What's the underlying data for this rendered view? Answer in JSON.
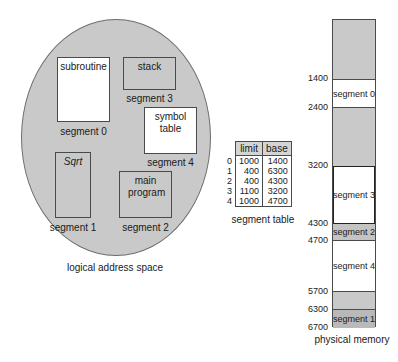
{
  "logical_space": {
    "caption": "logical address space",
    "segments": [
      {
        "name": "subroutine",
        "label": "segment 0"
      },
      {
        "name": "Sqrt",
        "label": "segment 1"
      },
      {
        "name": "main program",
        "label": "segment 2"
      },
      {
        "name": "stack",
        "label": "segment 3"
      },
      {
        "name": "symbol table",
        "label": "segment 4"
      }
    ]
  },
  "segment_table": {
    "caption": "segment table",
    "headers": [
      "limit",
      "base"
    ],
    "rows": [
      {
        "index": "0",
        "limit": "1000",
        "base": "1400"
      },
      {
        "index": "1",
        "limit": "400",
        "base": "6300"
      },
      {
        "index": "2",
        "limit": "400",
        "base": "4300"
      },
      {
        "index": "3",
        "limit": "1100",
        "base": "3200"
      },
      {
        "index": "4",
        "limit": "1000",
        "base": "4700"
      }
    ]
  },
  "physical_memory": {
    "caption": "physical memory",
    "addresses": [
      "1400",
      "2400",
      "3200",
      "4300",
      "4700",
      "5700",
      "6300",
      "6700"
    ],
    "blocks": [
      {
        "label": "",
        "state": "free"
      },
      {
        "label": "segment 0",
        "state": "used"
      },
      {
        "label": "",
        "state": "free"
      },
      {
        "label": "segment 3",
        "state": "used"
      },
      {
        "label": "segment 2",
        "state": "used"
      },
      {
        "label": "segment 4",
        "state": "used"
      },
      {
        "label": "",
        "state": "free"
      },
      {
        "label": "segment 1",
        "state": "used"
      }
    ]
  },
  "colors": {
    "free": "#c9c9c9",
    "segment_white": "#ffffff",
    "segment_gray": "#c4c4c4",
    "outline": "#4a4a4a"
  }
}
